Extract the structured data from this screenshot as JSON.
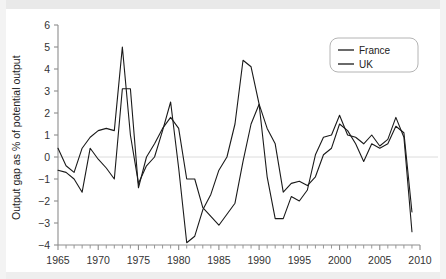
{
  "chart_data": {
    "type": "line",
    "title": "",
    "xlabel": "",
    "ylabel": "Output gap as % of potential output",
    "xlim": [
      1965,
      2010
    ],
    "ylim": [
      -4,
      6
    ],
    "ytick_labels": [
      "6",
      "5",
      "4",
      "3",
      "2",
      "1",
      "0",
      "−1",
      "−2",
      "−3",
      "−4"
    ],
    "ytick_values": [
      6,
      5,
      4,
      3,
      2,
      1,
      0,
      -1,
      -2,
      -3,
      -4
    ],
    "xtick_labels": [
      "1965",
      "1970",
      "1975",
      "1980",
      "1985",
      "1990",
      "1995",
      "2000",
      "2005",
      "2010"
    ],
    "xtick_values": [
      1965,
      1970,
      1975,
      1980,
      1985,
      1990,
      1995,
      2000,
      2005,
      2010
    ],
    "minor_xticks_every": 1,
    "grid": false,
    "zero_line": true,
    "legend_position": "top-right",
    "x": [
      1965,
      1966,
      1967,
      1968,
      1969,
      1970,
      1971,
      1972,
      1973,
      1974,
      1975,
      1976,
      1977,
      1978,
      1979,
      1980,
      1981,
      1982,
      1983,
      1984,
      1985,
      1986,
      1987,
      1988,
      1989,
      1990,
      1991,
      1992,
      1993,
      1994,
      1995,
      1996,
      1997,
      1998,
      1999,
      2000,
      2001,
      2002,
      2003,
      2004,
      2005,
      2006,
      2007,
      2008,
      2009
    ],
    "series": [
      {
        "name": "France",
        "color": "#1a1a1a",
        "values": [
          -0.6,
          -0.7,
          -1.0,
          -1.6,
          0.4,
          -0.1,
          -0.5,
          -1.0,
          3.1,
          3.1,
          -1.4,
          0.0,
          0.6,
          1.3,
          1.8,
          1.3,
          -1.0,
          -1.0,
          -2.3,
          -2.7,
          -3.1,
          -2.6,
          -2.1,
          -0.2,
          1.5,
          2.4,
          1.3,
          0.6,
          -1.6,
          -1.2,
          -1.1,
          -1.3,
          -0.9,
          0.1,
          0.4,
          1.5,
          1.2,
          0.6,
          -0.2,
          0.6,
          0.4,
          0.6,
          1.4,
          1.1,
          -2.5
        ]
      },
      {
        "name": "UK",
        "color": "#1a1a1a",
        "values": [
          0.4,
          -0.4,
          -0.7,
          0.4,
          0.9,
          1.2,
          1.3,
          1.2,
          5.0,
          1.0,
          -1.2,
          -0.4,
          0.0,
          1.2,
          2.5,
          -0.5,
          -3.9,
          -3.6,
          -2.4,
          -1.7,
          -0.6,
          0.0,
          1.5,
          4.4,
          4.1,
          2.4,
          -0.9,
          -2.8,
          -2.8,
          -1.8,
          -2.0,
          -1.5,
          0.1,
          0.9,
          1.0,
          1.9,
          1.0,
          0.9,
          0.6,
          1.0,
          0.5,
          0.8,
          1.8,
          0.9,
          -3.4
        ]
      }
    ]
  },
  "legend": {
    "entries": [
      {
        "label": "France"
      },
      {
        "label": "UK"
      }
    ]
  }
}
